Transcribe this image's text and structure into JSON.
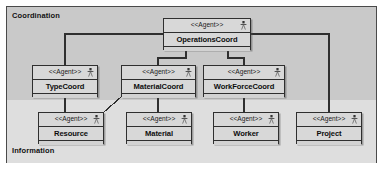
{
  "diagram": {
    "frame": {
      "border_color": "#4a4a4a"
    },
    "layers": [
      {
        "id": "coordination",
        "label": "Coordination",
        "background": "#c9c9c9"
      },
      {
        "id": "information",
        "label": "Information",
        "background": "#dedede"
      }
    ],
    "stereotype": "<<Agent>>",
    "icon_name": "agent-icon",
    "nodes": [
      {
        "id": "operations-coord",
        "name": "OperationsCoord",
        "stereotype": "<<Agent>>",
        "layer": "coordination",
        "x": 163,
        "y": 18,
        "w": 88,
        "h": 32
      },
      {
        "id": "type-coord",
        "name": "TypeCoord",
        "stereotype": "<<Agent>>",
        "layer": "coordination",
        "x": 32,
        "y": 65,
        "w": 66,
        "h": 32
      },
      {
        "id": "material-coord",
        "name": "MaterialCoord",
        "stereotype": "<<Agent>>",
        "layer": "coordination",
        "x": 121,
        "y": 65,
        "w": 75,
        "h": 32
      },
      {
        "id": "work-force-coord",
        "name": "WorkForceCoord",
        "stereotype": "<<Agent>>",
        "layer": "coordination",
        "x": 203,
        "y": 65,
        "w": 82,
        "h": 32
      },
      {
        "id": "resource",
        "name": "Resource",
        "stereotype": "<<Agent>>",
        "layer": "information",
        "x": 38,
        "y": 112,
        "w": 66,
        "h": 32
      },
      {
        "id": "material",
        "name": "Material",
        "stereotype": "<<Agent>>",
        "layer": "information",
        "x": 126,
        "y": 112,
        "w": 66,
        "h": 32
      },
      {
        "id": "worker",
        "name": "Worker",
        "stereotype": "<<Agent>>",
        "layer": "information",
        "x": 213,
        "y": 112,
        "w": 66,
        "h": 32
      },
      {
        "id": "project",
        "name": "Project",
        "stereotype": "<<Agent>>",
        "layer": "information",
        "x": 296,
        "y": 112,
        "w": 66,
        "h": 32
      }
    ],
    "connections": [
      {
        "from": "operations-coord",
        "to": "type-coord",
        "name": "link-operationscoord-typecoord"
      },
      {
        "from": "operations-coord",
        "to": "material-coord",
        "name": "link-operationscoord-materialcoord"
      },
      {
        "from": "operations-coord",
        "to": "work-force-coord",
        "name": "link-operationscoord-workforcecoord"
      },
      {
        "from": "operations-coord",
        "to": "project",
        "name": "link-operationscoord-project"
      },
      {
        "from": "type-coord",
        "to": "resource",
        "name": "link-typecoord-resource"
      },
      {
        "from": "material-coord",
        "to": "material",
        "name": "link-materialcoord-material"
      },
      {
        "from": "material-coord",
        "to": "resource",
        "name": "link-materialcoord-resource"
      },
      {
        "from": "work-force-coord",
        "to": "worker",
        "name": "link-workforcecoord-worker"
      }
    ],
    "line_color": "#2f2f2f"
  }
}
